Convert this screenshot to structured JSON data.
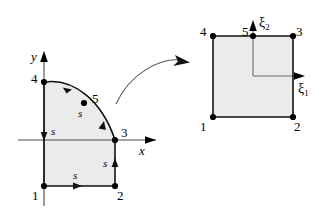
{
  "figure": {
    "caption_absent": true,
    "background_color": "#ffffff",
    "element_fill_color": "#ebebeb",
    "edge_color": "#111111",
    "axis_color": "#4a4a4a"
  },
  "physical_element": {
    "name": "physical-element",
    "axes": {
      "x_label": "x",
      "y_label": "y"
    },
    "node_labels": [
      {
        "id": "1",
        "text": "1"
      },
      {
        "id": "2",
        "text": "2"
      },
      {
        "id": "3",
        "text": "3"
      },
      {
        "id": "4",
        "text": "4"
      },
      {
        "id": "5",
        "text": "5"
      }
    ],
    "side_labels": [
      {
        "id": "s-bottom",
        "text": "s"
      },
      {
        "id": "s-right",
        "text": "s"
      },
      {
        "id": "s-left",
        "text": "s"
      },
      {
        "id": "s-arc",
        "text": "s"
      }
    ]
  },
  "parent_element": {
    "name": "parent-element",
    "axes": {
      "xi1_label": "ξ",
      "xi1_sub": "1",
      "xi2_label": "ξ",
      "xi2_sub": "2"
    },
    "node_labels": [
      {
        "id": "1",
        "text": "1"
      },
      {
        "id": "2",
        "text": "2"
      },
      {
        "id": "3",
        "text": "3"
      },
      {
        "id": "4",
        "text": "4"
      },
      {
        "id": "5",
        "text": "5"
      }
    ]
  },
  "mapping_arrow": {
    "name": "mapping-arrow",
    "label": ""
  }
}
